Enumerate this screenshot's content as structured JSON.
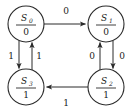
{
  "diagram": {
    "type": "state-transition-diagram",
    "machine_model": "Moore",
    "background_color": "#ffffff",
    "line_color": "#2b2b2b",
    "states": [
      {
        "id": "S0",
        "name": "S",
        "subscript": "0",
        "output": "0",
        "position": "top-left",
        "cx": 26,
        "cy": 24,
        "r": 18
      },
      {
        "id": "S1",
        "name": "S",
        "subscript": "1",
        "output": "0",
        "position": "top-right",
        "cx": 106,
        "cy": 24,
        "r": 18
      },
      {
        "id": "S2",
        "name": "S",
        "subscript": "2",
        "output": "1",
        "position": "bottom-right",
        "cx": 106,
        "cy": 87,
        "r": 18
      },
      {
        "id": "S3",
        "name": "S",
        "subscript": "3",
        "output": "1",
        "position": "bottom-left",
        "cx": 26,
        "cy": 87,
        "r": 18
      }
    ],
    "transitions": [
      {
        "id": "t-s0-s1",
        "from": "S0",
        "to": "S1",
        "label": "0",
        "edge": "top",
        "direction": "right",
        "label_x": 66,
        "label_y": 14
      },
      {
        "id": "t-s1-s2",
        "from": "S1",
        "to": "S2",
        "label": "0",
        "edge": "right-outer",
        "direction": "down",
        "label_x": 122,
        "label_y": 59
      },
      {
        "id": "t-s2-s1",
        "from": "S2",
        "to": "S1",
        "label": "0",
        "edge": "right-inner",
        "direction": "up",
        "label_x": 92,
        "label_y": 59
      },
      {
        "id": "t-s2-s3",
        "from": "S2",
        "to": "S3",
        "label": "1",
        "edge": "bottom",
        "direction": "left",
        "label_x": 66,
        "label_y": 106
      },
      {
        "id": "t-s0-s3",
        "from": "S0",
        "to": "S3",
        "label": "1",
        "edge": "left-outer",
        "direction": "down",
        "label_x": 11,
        "label_y": 59
      },
      {
        "id": "t-s3-s0",
        "from": "S3",
        "to": "S0",
        "label": "1",
        "edge": "left-inner",
        "direction": "up",
        "label_x": 39,
        "label_y": 59
      }
    ]
  }
}
